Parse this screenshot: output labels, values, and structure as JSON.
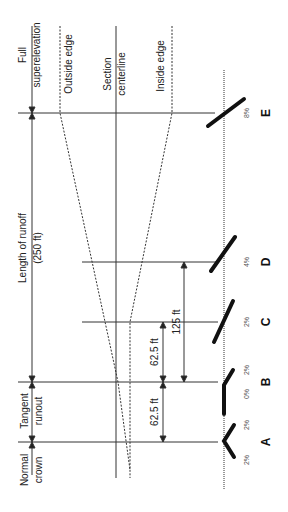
{
  "diagram": {
    "region_labels": {
      "full_superelevation": [
        "Full",
        "superelevation"
      ],
      "length_of_runoff": [
        "Length of runoff",
        "(250 ft)"
      ],
      "tangent_runout": [
        "Tangent",
        "runout"
      ],
      "normal_crown": [
        "Normal",
        "crown"
      ]
    },
    "edge_labels": {
      "outside_edge": "Outside edge",
      "section_centerline": [
        "Section",
        "centerline"
      ],
      "inside_edge": "Inside edge"
    },
    "dimensions": {
      "d1": "62.5 ft",
      "d2": "62.5 ft",
      "d3": "125 ft"
    },
    "sections": [
      {
        "id": "A",
        "label": "A",
        "left_slope": "2%",
        "right_slope": "2%"
      },
      {
        "id": "B",
        "label": "B",
        "left_slope": "0%",
        "right_slope": "2%"
      },
      {
        "id": "C",
        "label": "C",
        "slope": "2%"
      },
      {
        "id": "D",
        "label": "D",
        "slope": "4%"
      },
      {
        "id": "E",
        "label": "E",
        "slope": "8%"
      }
    ],
    "colors": {
      "line": "#333333",
      "section_bar": "#111111",
      "text": "#222222"
    }
  }
}
